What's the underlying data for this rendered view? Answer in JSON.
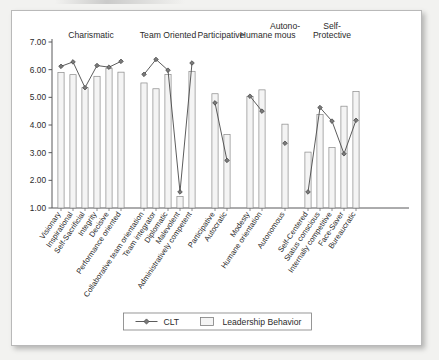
{
  "figure": {
    "background_color": "#f2f2f0",
    "card_color": "#ffffff",
    "border_color": "#b9b9b9"
  },
  "legend": {
    "position": "bottom-center",
    "entries": [
      {
        "label": "CLT",
        "marker": "line-with-diamond-marker",
        "color": "#4a4a4a"
      },
      {
        "label": "Leadership Behavior",
        "marker": "bar-swatch",
        "color": "#f4f4f4"
      }
    ]
  },
  "chart_data": {
    "type": "bar",
    "title": "",
    "subtitle": "",
    "xlabel": "",
    "ylabel": "",
    "ylim": [
      1.0,
      7.0
    ],
    "ytick_labels": [
      "1.00",
      "2.00",
      "3.00",
      "4.00",
      "5.00",
      "6.00",
      "7.00"
    ],
    "yticks": [
      1.0,
      2.0,
      3.0,
      4.0,
      5.0,
      6.0,
      7.0
    ],
    "grid": false,
    "legend_position": "bottom",
    "group_labels": [
      "Charismatic",
      "Team Oriented",
      "Participative",
      "Humane",
      "Autono-\nmous",
      "Self-\nProtective"
    ],
    "groups": [
      {
        "name": "Charismatic",
        "label_line1": "Charismatic",
        "label_line2": "",
        "categories": [
          "Visionary",
          "Inspirational",
          "Self-Sacrificial",
          "Integrity",
          "Decisive",
          "Performance oriented"
        ]
      },
      {
        "name": "Team Oriented",
        "label_line1": "Team Oriented",
        "label_line2": "",
        "categories": [
          "Collaborative team orientation",
          "Team integrator",
          "Diplomatic",
          "Malevolent",
          "Administratively competent"
        ]
      },
      {
        "name": "Participative",
        "label_line1": "Participative",
        "label_line2": "",
        "categories": [
          "Participative",
          "Autocratic"
        ]
      },
      {
        "name": "Humane",
        "label_line1": "Humane",
        "label_line2": "",
        "categories": [
          "Modesty",
          "Humane orientation"
        ]
      },
      {
        "name": "Autonomous",
        "label_line1": "Autono-",
        "label_line2": "mous",
        "categories": [
          "Autonomous"
        ]
      },
      {
        "name": "Self-Protective",
        "label_line1": "Self-",
        "label_line2": "Protective",
        "categories": [
          "Self-Centered",
          "Status conscious",
          "Internally competitive",
          "Face-Saver",
          "Bureaucratic"
        ]
      }
    ],
    "categories": [
      "Visionary",
      "Inspirational",
      "Self-Sacrificial",
      "Integrity",
      "Decisive",
      "Performance oriented",
      "Collaborative team orientation",
      "Team integrator",
      "Diplomatic",
      "Malevolent",
      "Administratively competent",
      "Participative",
      "Autocratic",
      "Modesty",
      "Humane orientation",
      "Autonomous",
      "Self-Centered",
      "Status conscious",
      "Internally competitive",
      "Face-Saver",
      "Bureaucratic"
    ],
    "series": [
      {
        "name": "Leadership Behavior",
        "type": "bar",
        "values": [
          5.9,
          5.82,
          5.35,
          5.76,
          6.05,
          5.91,
          5.52,
          5.31,
          5.83,
          1.42,
          5.94,
          5.13,
          3.66,
          5.03,
          5.27,
          4.03,
          3.02,
          4.38,
          3.19,
          4.68,
          5.21
        ]
      },
      {
        "name": "CLT",
        "type": "line",
        "values": [
          6.12,
          6.28,
          5.35,
          6.15,
          6.09,
          6.3,
          5.83,
          6.37,
          5.98,
          1.58,
          6.24,
          4.8,
          2.72,
          5.04,
          4.5,
          3.34,
          1.58,
          4.63,
          4.14,
          2.96,
          4.17
        ]
      }
    ]
  }
}
